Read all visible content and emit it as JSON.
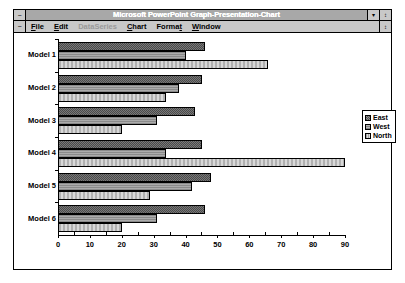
{
  "window": {
    "title": "Microsoft PowerPoint Graph-Presentation-Chart",
    "system_menu_glyph": "−",
    "minimize_glyph": "▾",
    "maximize_glyph": "↕",
    "doc_menu_glyph": "−",
    "doc_restore_glyph": "↕"
  },
  "menu": {
    "items": [
      {
        "label": "File",
        "accel": "F",
        "disabled": false
      },
      {
        "label": "Edit",
        "accel": "E",
        "disabled": false
      },
      {
        "label": "DataSeries",
        "accel": "D",
        "disabled": true
      },
      {
        "label": "Chart",
        "accel": "C",
        "disabled": false
      },
      {
        "label": "Format",
        "accel": "t",
        "disabled": false
      },
      {
        "label": "Window",
        "accel": "W",
        "disabled": false
      }
    ]
  },
  "legend": {
    "entries": [
      {
        "label": "East",
        "key": "east"
      },
      {
        "label": "West",
        "key": "west"
      },
      {
        "label": "North",
        "key": "north"
      }
    ]
  },
  "chart_data": {
    "type": "bar",
    "orientation": "horizontal",
    "title": "",
    "xlabel": "",
    "ylabel": "",
    "xlim": [
      0,
      90
    ],
    "xticks": [
      0,
      10,
      20,
      30,
      40,
      50,
      60,
      70,
      80,
      90
    ],
    "grid": false,
    "legend_position": "right",
    "categories": [
      "Model 1",
      "Model 2",
      "Model 3",
      "Model 4",
      "Model 5",
      "Model 6"
    ],
    "series": [
      {
        "name": "East",
        "values": [
          46,
          45,
          43,
          45,
          48,
          46
        ]
      },
      {
        "name": "West",
        "values": [
          40,
          38,
          31,
          34,
          42,
          31
        ]
      },
      {
        "name": "North",
        "values": [
          66,
          34,
          20,
          90,
          29,
          20
        ]
      }
    ]
  }
}
